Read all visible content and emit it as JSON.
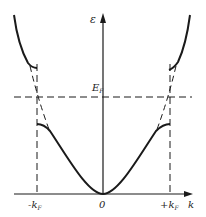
{
  "diagram": {
    "type": "band-structure",
    "y_axis_label": "ε",
    "x_axis_label": "k",
    "fermi_level_label": "E",
    "fermi_level_subscript": "F",
    "tick_labels": {
      "left": "-k",
      "left_sub": "F",
      "origin": "0",
      "right": "+k",
      "right_sub": "F"
    },
    "colors": {
      "line": "#1a1a1a",
      "background": "#ffffff"
    }
  }
}
